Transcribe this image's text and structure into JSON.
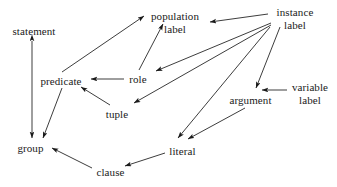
{
  "diagram": {
    "stroke_color": "#1a1a1a",
    "text_color": "#1a1a1a",
    "background_color": "#ffffff",
    "nodes": [
      {
        "id": "statement",
        "lines": [
          "statement"
        ],
        "x": 8,
        "y": 25,
        "w": 52
      },
      {
        "id": "predicate",
        "lines": [
          "predicate"
        ],
        "x": 36,
        "y": 75,
        "w": 50
      },
      {
        "id": "group",
        "lines": [
          "group"
        ],
        "x": 14,
        "y": 142,
        "w": 33
      },
      {
        "id": "population-label",
        "lines": [
          "population",
          "label"
        ],
        "x": 148,
        "y": 10,
        "w": 54
      },
      {
        "id": "role",
        "lines": [
          "role"
        ],
        "x": 127,
        "y": 73,
        "w": 22
      },
      {
        "id": "tuple",
        "lines": [
          "tuple"
        ],
        "x": 104,
        "y": 108,
        "w": 26
      },
      {
        "id": "instance-label",
        "lines": [
          "instance",
          "label"
        ],
        "x": 272,
        "y": 6,
        "w": 46
      },
      {
        "id": "argument",
        "lines": [
          "argument"
        ],
        "x": 228,
        "y": 94,
        "w": 45
      },
      {
        "id": "variable-label",
        "lines": [
          "variable",
          "label"
        ],
        "x": 290,
        "y": 81,
        "w": 40
      },
      {
        "id": "literal",
        "lines": [
          "literal"
        ],
        "x": 167,
        "y": 145,
        "w": 31
      },
      {
        "id": "clause",
        "lines": [
          "clause"
        ],
        "x": 94,
        "y": 166,
        "w": 33
      }
    ],
    "edges": [
      {
        "id": "statement-group",
        "from": "statement",
        "to": "group",
        "arrow": "both"
      },
      {
        "id": "predicate-population",
        "from": "predicate",
        "to": "population-label",
        "arrow": "to"
      },
      {
        "id": "role-population",
        "from": "role",
        "to": "population-label",
        "arrow": "to"
      },
      {
        "id": "instance-population",
        "from": "instance-label",
        "to": "population-label",
        "arrow": "to"
      },
      {
        "id": "instance-role",
        "from": "instance-label",
        "to": "role",
        "arrow": "to"
      },
      {
        "id": "instance-tuple",
        "from": "instance-label",
        "to": "tuple",
        "arrow": "to"
      },
      {
        "id": "instance-argument",
        "from": "instance-label",
        "to": "argument",
        "arrow": "to"
      },
      {
        "id": "instance-literal",
        "from": "instance-label",
        "to": "literal",
        "arrow": "to"
      },
      {
        "id": "role-predicate",
        "from": "role",
        "to": "predicate",
        "arrow": "to"
      },
      {
        "id": "tuple-predicate",
        "from": "tuple",
        "to": "predicate",
        "arrow": "to"
      },
      {
        "id": "predicate-group",
        "from": "predicate",
        "to": "group",
        "arrow": "to"
      },
      {
        "id": "variable-argument",
        "from": "variable-label",
        "to": "argument",
        "arrow": "to"
      },
      {
        "id": "argument-literal",
        "from": "argument",
        "to": "literal",
        "arrow": "to"
      },
      {
        "id": "literal-clause",
        "from": "literal",
        "to": "clause",
        "arrow": "to"
      },
      {
        "id": "clause-group",
        "from": "clause",
        "to": "group",
        "arrow": "to"
      }
    ],
    "edge_geometry": {
      "statement-group": {
        "x1": 32,
        "y1": 41,
        "x2": 32,
        "y2": 138
      },
      "predicate-population": {
        "x1": 62,
        "y1": 72,
        "x2": 144,
        "y2": 16
      },
      "role-population": {
        "x1": 139,
        "y1": 70,
        "x2": 163,
        "y2": 24
      },
      "instance-population": {
        "x1": 268,
        "y1": 14,
        "x2": 210,
        "y2": 22
      },
      "instance-role": {
        "x1": 271,
        "y1": 23,
        "x2": 156,
        "y2": 71
      },
      "instance-tuple": {
        "x1": 271,
        "y1": 25,
        "x2": 134,
        "y2": 103
      },
      "instance-argument": {
        "x1": 280,
        "y1": 27,
        "x2": 256,
        "y2": 88
      },
      "instance-literal": {
        "x1": 270,
        "y1": 27,
        "x2": 178,
        "y2": 138
      },
      "role-predicate": {
        "x1": 124,
        "y1": 79,
        "x2": 91,
        "y2": 79
      },
      "tuple-predicate": {
        "x1": 110,
        "y1": 105,
        "x2": 81,
        "y2": 87
      },
      "predicate-group": {
        "x1": 62,
        "y1": 88,
        "x2": 43,
        "y2": 138
      },
      "variable-argument": {
        "x1": 287,
        "y1": 90,
        "x2": 262,
        "y2": 90
      },
      "argument-literal": {
        "x1": 245,
        "y1": 108,
        "x2": 188,
        "y2": 139
      },
      "literal-clause": {
        "x1": 165,
        "y1": 153,
        "x2": 125,
        "y2": 166
      },
      "clause-group": {
        "x1": 92,
        "y1": 168,
        "x2": 52,
        "y2": 148
      }
    }
  }
}
